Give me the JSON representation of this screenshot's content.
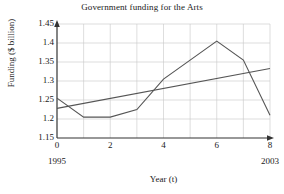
{
  "chart_data": {
    "type": "line",
    "title": "Government funding for the Arts",
    "xlabel": "Year (t)",
    "ylabel": "Funding ($ billion)",
    "xlim": [
      0,
      8
    ],
    "ylim": [
      1.15,
      1.45
    ],
    "xticks": [
      "0",
      "2",
      "4",
      "6",
      "8"
    ],
    "xtick_values": [
      0,
      2,
      4,
      6,
      8
    ],
    "yticks": [
      "1.15",
      "1.2",
      "1.25",
      "1.3",
      "1.35",
      "1.4",
      "1.45"
    ],
    "ytick_values": [
      1.15,
      1.2,
      1.25,
      1.3,
      1.35,
      1.4,
      1.45
    ],
    "grid": true,
    "legend": "none",
    "x_annotations": [
      {
        "x": 0,
        "label": "1995"
      },
      {
        "x": 8,
        "label": "2003"
      }
    ],
    "series": [
      {
        "name": "Funding",
        "color": "#555555",
        "x": [
          0,
          1,
          2,
          3,
          4,
          5,
          6,
          7,
          8
        ],
        "values": [
          1.255,
          1.205,
          1.205,
          1.225,
          1.305,
          1.355,
          1.405,
          1.355,
          1.21
        ]
      },
      {
        "name": "Trend line",
        "color": "#555555",
        "x": [
          0,
          8
        ],
        "values": [
          1.228,
          1.333
        ]
      }
    ]
  }
}
